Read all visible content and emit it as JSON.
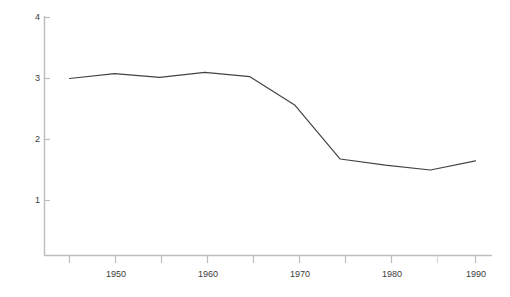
{
  "chart_data": {
    "type": "line",
    "title": "",
    "subtitle": "",
    "xlabel": "",
    "ylabel": "",
    "x": [
      1945,
      1950,
      1955,
      1960,
      1965,
      1970,
      1975,
      1980,
      1985,
      1990
    ],
    "values": [
      3.0,
      3.08,
      3.02,
      3.1,
      3.03,
      2.56,
      1.68,
      1.58,
      1.5,
      1.65
    ],
    "series": [
      {
        "name": "",
        "values": [
          3.0,
          3.08,
          3.02,
          3.1,
          3.03,
          2.56,
          1.68,
          1.58,
          1.5,
          1.65
        ]
      }
    ],
    "xlim": [
      1943.5,
      1992.0
    ],
    "ylim": [
      0.1,
      4.25
    ],
    "grid": false,
    "legend": false,
    "legend_position": "none",
    "x_major_ticks": [
      1950,
      1960,
      1970,
      1980,
      1990
    ],
    "x_minor_ticks": [
      1945,
      1955,
      1965,
      1975,
      1985
    ],
    "x_tick_labels": [
      "1950",
      "1960",
      "1970",
      "1980",
      "1990"
    ],
    "y_ticks": [
      1,
      2,
      3,
      4
    ],
    "y_tick_labels": [
      "1",
      "2",
      "3",
      "4"
    ],
    "annotations": []
  },
  "style": {
    "line_color": "#434343",
    "axis_color": "#bdbdbd",
    "tick_label_color": "#3b3b3b",
    "background_color": "#ffffff"
  },
  "axes": {
    "y_ticks": [
      {
        "label": "4",
        "value": 4
      },
      {
        "label": "3",
        "value": 3
      },
      {
        "label": "2",
        "value": 2
      },
      {
        "label": "1",
        "value": 1
      }
    ],
    "x_ticks": [
      {
        "label": "1950",
        "value": 1950
      },
      {
        "label": "1960",
        "value": 1960
      },
      {
        "label": "1970",
        "value": 1970
      },
      {
        "label": "1980",
        "value": 1980
      },
      {
        "label": "1990",
        "value": 1990
      }
    ]
  }
}
